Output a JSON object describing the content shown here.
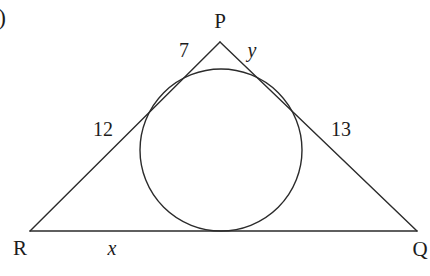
{
  "figure": {
    "type": "geometry-diagram",
    "background_color": "#ffffff",
    "stroke_color": "#2b2b2b",
    "text_color": "#1c1c1c",
    "item_marker": ")",
    "vertices": [
      {
        "name": "P",
        "label": "P",
        "x": 220,
        "y": 42,
        "label_x": 220,
        "label_y": 21
      },
      {
        "name": "Q",
        "label": "Q",
        "x": 417,
        "y": 231,
        "label_x": 420,
        "label_y": 249
      },
      {
        "name": "R",
        "label": "R",
        "x": 30,
        "y": 231,
        "label_x": 20,
        "label_y": 248
      }
    ],
    "sides": [
      {
        "name": "PR-upper-segment",
        "label": "7",
        "label_x": 184,
        "label_y": 50,
        "italic": false
      },
      {
        "name": "PQ-upper-segment",
        "label": "y",
        "label_x": 252,
        "label_y": 50,
        "italic": true
      },
      {
        "name": "PR-lower-segment",
        "label": "12",
        "label_x": 103,
        "label_y": 129,
        "italic": false
      },
      {
        "name": "PQ-lower-segment",
        "label": "13",
        "label_x": 341,
        "label_y": 129,
        "italic": false
      },
      {
        "name": "RQ-base",
        "label": "x",
        "label_x": 112,
        "label_y": 248,
        "italic": true
      }
    ],
    "incircle": {
      "center_x": 221,
      "center_y": 150,
      "radius": 81
    }
  }
}
